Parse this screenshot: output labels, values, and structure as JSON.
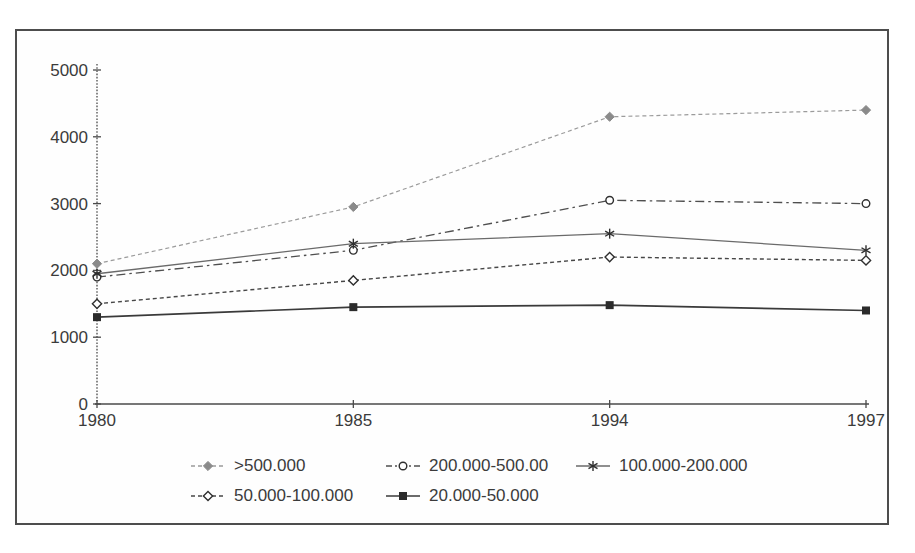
{
  "chart_data": {
    "type": "line",
    "title": "",
    "xlabel": "",
    "ylabel": "",
    "categories": [
      "1980",
      "1985",
      "1994",
      "1997"
    ],
    "y_ticks": [
      0,
      1000,
      2000,
      3000,
      4000,
      5000
    ],
    "ylim": [
      0,
      5000
    ],
    "grid": false,
    "legend_position": "bottom-two-rows",
    "series": [
      {
        "name": ">500.000",
        "values": [
          2100,
          2950,
          4300,
          4400
        ],
        "marker": "diamond-filled",
        "line": "dashed",
        "color": "#9b9b9b",
        "marker_color": "#8a8a8a"
      },
      {
        "name": "200.000-500.00",
        "values": [
          1900,
          2300,
          3050,
          3000
        ],
        "marker": "circle-open",
        "line": "dashdot",
        "color": "#4f4f4f"
      },
      {
        "name": "100.000-200.000",
        "values": [
          1950,
          2400,
          2550,
          2300
        ],
        "marker": "asterisk",
        "line": "solid",
        "color": "#6a6a6a"
      },
      {
        "name": "50.000-100.000",
        "values": [
          1500,
          1850,
          2200,
          2150
        ],
        "marker": "diamond-open",
        "line": "dashed",
        "color": "#474747"
      },
      {
        "name": "20.000-50.000",
        "values": [
          1300,
          1450,
          1480,
          1400
        ],
        "marker": "square-filled",
        "line": "solid",
        "color": "#3a3a3a"
      }
    ],
    "axis_color": "#4a4a4a",
    "label_color": "#3b3b3b"
  }
}
